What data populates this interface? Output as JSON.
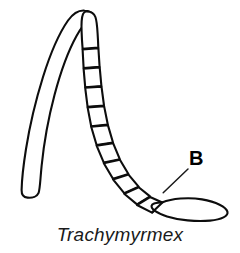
{
  "figure": {
    "domain": "diagram",
    "kind": "scientific-line-drawing",
    "caption": "Trachymyrmex",
    "background_color": "#ffffff",
    "ink_color": "#0d0d0d",
    "canvas": {
      "width": 240,
      "height": 253
    }
  },
  "labels": {
    "callout_b": {
      "text": "B",
      "refers_to": "apical-funicular-segment",
      "x": 189,
      "y": 148,
      "leader_from": {
        "x": 163,
        "y": 193
      },
      "leader_to": {
        "x": 188,
        "y": 169
      }
    }
  },
  "parts": {
    "scape": {
      "name": "scape",
      "description": "long curved basal segment bending at apex",
      "tip_x": 85,
      "tip_y": 12,
      "base_x": 31,
      "base_y": 196
    },
    "pedicel": {
      "name": "pedicel",
      "description": "first short segment below scape bend"
    },
    "funiculus": {
      "name": "funiculus",
      "segment_count": 11,
      "description": "chain of rectangular flagellar segments curving down-right"
    },
    "club": {
      "name": "antennal-club",
      "description": "elongate apical club, pointed distally",
      "center_x": 192,
      "center_y": 207,
      "length": 68,
      "width": 23
    }
  }
}
